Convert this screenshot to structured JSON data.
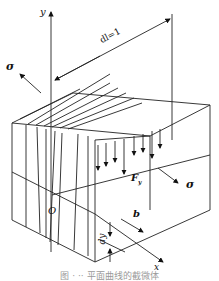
{
  "figure": {
    "type": "3D element diagram",
    "labels": {
      "y_axis": "y",
      "x_axis": "x",
      "origin": "O",
      "dimension": "dl=1",
      "sigma_left": "σ",
      "sigma_right": "σ",
      "force": "F",
      "force_subscript": "y",
      "width": "b",
      "height": "dy"
    },
    "caption": "图 · ·· 平面曲线的截微体"
  }
}
